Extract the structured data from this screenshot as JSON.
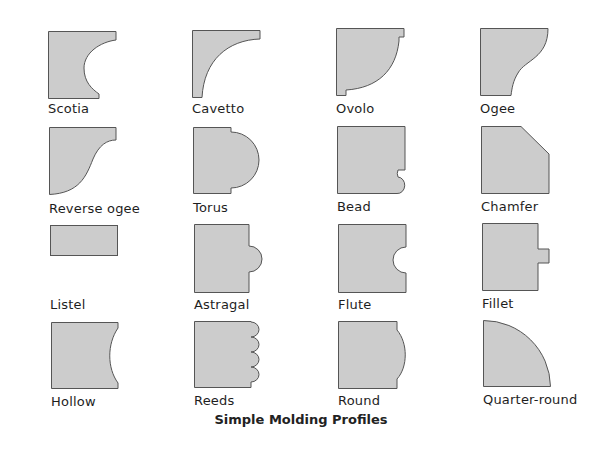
{
  "title": "Simple Molding Profiles",
  "colors": {
    "fill": "#cccccc",
    "stroke": "#555555",
    "text": "#1e1e1e"
  },
  "profiles": [
    {
      "name": "Scotia"
    },
    {
      "name": "Cavetto"
    },
    {
      "name": "Ovolo"
    },
    {
      "name": "Ogee"
    },
    {
      "name": "Reverse ogee"
    },
    {
      "name": "Torus"
    },
    {
      "name": "Bead"
    },
    {
      "name": "Chamfer"
    },
    {
      "name": "Listel"
    },
    {
      "name": "Astragal"
    },
    {
      "name": "Flute"
    },
    {
      "name": "Fillet"
    },
    {
      "name": "Hollow"
    },
    {
      "name": "Reeds"
    },
    {
      "name": "Round"
    },
    {
      "name": "Quarter-round"
    }
  ]
}
